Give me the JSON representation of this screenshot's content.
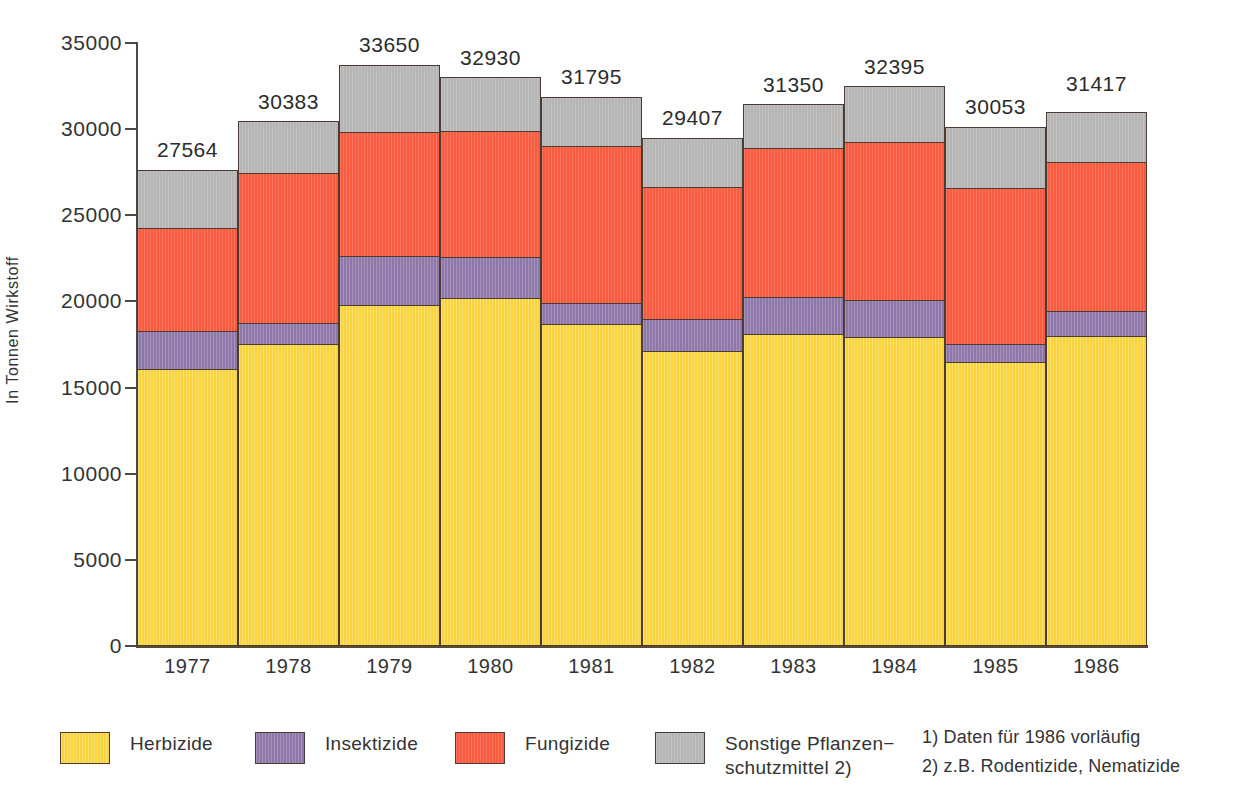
{
  "chart_data": {
    "type": "bar",
    "subtype": "stacked-bar",
    "title": "",
    "xlabel": "",
    "ylabel": "In Tonnen Wirkstoff",
    "ylim": [
      0,
      35000
    ],
    "ytick_values": [
      0,
      5000,
      10000,
      15000,
      20000,
      25000,
      30000,
      35000
    ],
    "ytick_labels": [
      "0",
      "5000",
      "10000",
      "15000",
      "20000",
      "25000",
      "30000",
      "35000"
    ],
    "grid": false,
    "legend_position": "bottom",
    "categories": [
      "1977",
      "1978",
      "1979",
      "1980",
      "1981",
      "1982",
      "1983",
      "1984",
      "1985",
      "1986"
    ],
    "series": [
      {
        "name": "Herbizide",
        "color": "#f8d33c",
        "values": [
          16000,
          17450,
          19760,
          20170,
          18660,
          17060,
          18060,
          17880,
          16440,
          17960
        ]
      },
      {
        "name": "Insektizide",
        "color": "#8d76a8",
        "values": [
          2200,
          1250,
          2800,
          2350,
          1170,
          1860,
          2120,
          2130,
          1050,
          1450
        ]
      },
      {
        "name": "Fungizide",
        "color": "#f95b3e",
        "values": [
          5980,
          8700,
          7230,
          7300,
          9150,
          7660,
          8650,
          9180,
          9050,
          8640
        ]
      },
      {
        "name": "Sonstige Pflanzenschutzmittel",
        "color": "#b5b5b5",
        "values": [
          3384,
          2983,
          3860,
          3110,
          2815,
          2827,
          2520,
          3205,
          3513,
          2877
        ]
      }
    ],
    "totals": [
      27564,
      30383,
      33650,
      32930,
      31795,
      29407,
      31350,
      32395,
      30053,
      31417
    ],
    "total_labels": [
      "27564",
      "30383",
      "33650",
      "32930",
      "31795",
      "29407",
      "31350",
      "32395",
      "30053",
      "31417"
    ]
  },
  "legend": {
    "items": [
      {
        "label": "Herbizide",
        "key": "herb"
      },
      {
        "label": "Insektizide",
        "key": "insek"
      },
      {
        "label": "Fungizide",
        "key": "fungi"
      },
      {
        "label": "Sonstige Pflanzen−\nschutzmittel 2)",
        "key": "sonst"
      }
    ]
  },
  "notes": [
    "1) Daten für 1986 vorläufig",
    "2) z.B. Rodentizide, Nematizide"
  ]
}
